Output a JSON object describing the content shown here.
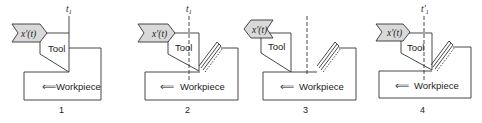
{
  "figure": {
    "panels": [
      {
        "index": "1",
        "time_label": "t",
        "time_sub": "1",
        "feed_label": "x'(t)",
        "tool_label": "Tool",
        "workpiece_label": "Workpiece",
        "arrow": "⟸"
      },
      {
        "index": "2",
        "time_label": "t",
        "time_sub": "1",
        "feed_label": "x'(t)",
        "tool_label": "Tool",
        "workpiece_label": "Workpiece",
        "arrow": "⟸"
      },
      {
        "index": "3",
        "time_label": "",
        "time_sub": "",
        "feed_label": "x'(t)",
        "tool_label": "Tool",
        "workpiece_label": "Workpiece",
        "arrow": "⟸"
      },
      {
        "index": "4",
        "time_label": "t'",
        "time_sub": "1",
        "feed_label": "x'(t)",
        "tool_label": "Tool",
        "workpiece_label": "Workpiece",
        "arrow": "⟸"
      }
    ],
    "colors": {
      "line": "#333333",
      "tag_fill": "#d9d9d9",
      "text": "#222222"
    }
  }
}
